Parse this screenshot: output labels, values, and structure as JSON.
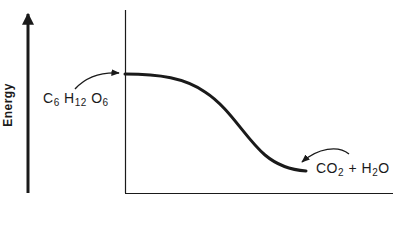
{
  "diagram": {
    "y_axis_label": "Energy",
    "reactant": {
      "label_parts": [
        {
          "text": "C",
          "sub": "6"
        },
        {
          "text": " H",
          "sub": "12"
        },
        {
          "text": " O",
          "sub": "6"
        }
      ]
    },
    "product": {
      "label_parts": [
        {
          "text": "CO",
          "sub": "2"
        },
        {
          "text": " + H",
          "sub": "2"
        },
        {
          "text": "O",
          "sub": ""
        }
      ]
    },
    "ink_color": "#1a1a1a",
    "background_color": "#ffffff"
  }
}
